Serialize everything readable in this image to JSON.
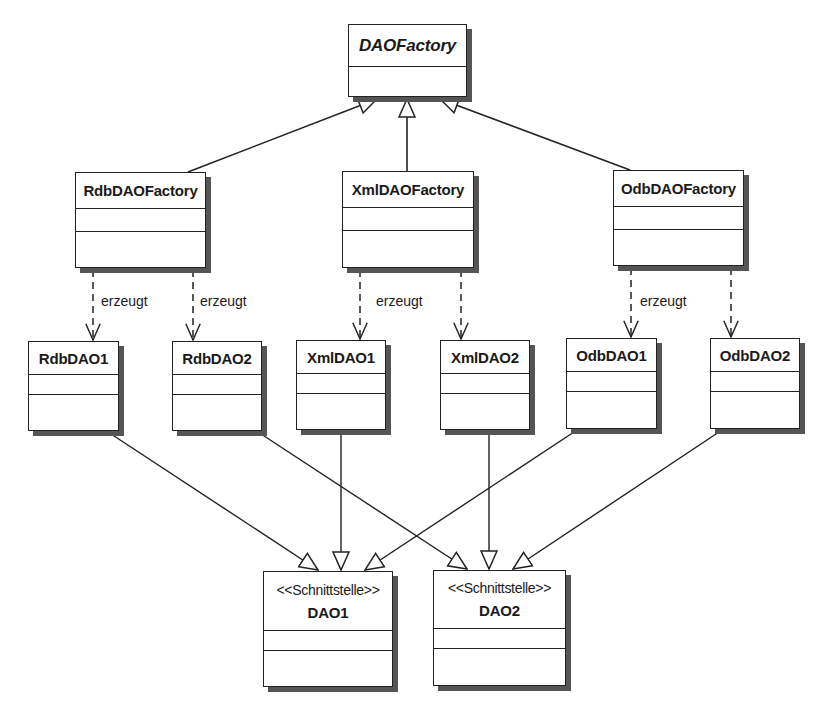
{
  "diagram": {
    "type": "UML class diagram",
    "classes": {
      "dao_factory": {
        "name": "DAOFactory",
        "abstract": true
      },
      "rdb_factory": {
        "name": "RdbDAOFactory"
      },
      "xml_factory": {
        "name": "XmlDAOFactory"
      },
      "odb_factory": {
        "name": "OdbDAOFactory"
      },
      "rdb_dao1": {
        "name": "RdbDAO1"
      },
      "rdb_dao2": {
        "name": "RdbDAO2"
      },
      "xml_dao1": {
        "name": "XmlDAO1"
      },
      "xml_dao2": {
        "name": "XmlDAO2"
      },
      "odb_dao1": {
        "name": "OdbDAO1"
      },
      "odb_dao2": {
        "name": "OdbDAO2"
      },
      "dao1": {
        "stereotype": "<<Schnittstelle>>",
        "name": "DAO1"
      },
      "dao2": {
        "stereotype": "<<Schnittstelle>>",
        "name": "DAO2"
      }
    },
    "dependency_labels": {
      "rdb_1": "erzeugt",
      "rdb_2": "erzeugt",
      "xml": "erzeugt",
      "odb": "erzeugt"
    },
    "relationships": [
      {
        "from": "RdbDAOFactory",
        "to": "DAOFactory",
        "kind": "generalization"
      },
      {
        "from": "XmlDAOFactory",
        "to": "DAOFactory",
        "kind": "generalization"
      },
      {
        "from": "OdbDAOFactory",
        "to": "DAOFactory",
        "kind": "generalization"
      },
      {
        "from": "RdbDAOFactory",
        "to": "RdbDAO1",
        "kind": "dependency",
        "label": "erzeugt"
      },
      {
        "from": "RdbDAOFactory",
        "to": "RdbDAO2",
        "kind": "dependency",
        "label": "erzeugt"
      },
      {
        "from": "XmlDAOFactory",
        "to": "XmlDAO1",
        "kind": "dependency",
        "label": "erzeugt"
      },
      {
        "from": "XmlDAOFactory",
        "to": "XmlDAO2",
        "kind": "dependency"
      },
      {
        "from": "OdbDAOFactory",
        "to": "OdbDAO1",
        "kind": "dependency",
        "label": "erzeugt"
      },
      {
        "from": "OdbDAOFactory",
        "to": "OdbDAO2",
        "kind": "dependency"
      },
      {
        "from": "RdbDAO1",
        "to": "DAO1",
        "kind": "realization"
      },
      {
        "from": "XmlDAO1",
        "to": "DAO1",
        "kind": "realization"
      },
      {
        "from": "OdbDAO1",
        "to": "DAO1",
        "kind": "realization"
      },
      {
        "from": "RdbDAO2",
        "to": "DAO2",
        "kind": "realization"
      },
      {
        "from": "XmlDAO2",
        "to": "DAO2",
        "kind": "realization"
      },
      {
        "from": "OdbDAO2",
        "to": "DAO2",
        "kind": "realization"
      }
    ]
  }
}
